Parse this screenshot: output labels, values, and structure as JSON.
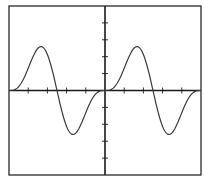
{
  "chart_data": {
    "type": "line",
    "title": "",
    "xlabel": "",
    "ylabel": "",
    "grid": false,
    "legend": null,
    "xlim": [
      -5,
      5
    ],
    "ylim": [
      -5,
      5
    ],
    "x_ticks": [
      -4,
      -3,
      -2,
      -1,
      0,
      1,
      2,
      3,
      4
    ],
    "y_ticks": [
      -4,
      -3,
      -2,
      -1,
      0,
      1,
      2,
      3,
      4
    ],
    "tick_labels_shown": false,
    "series": [
      {
        "name": "waveform",
        "color": "#3a3a3a",
        "x": [
          -5.0,
          -4.75,
          -4.5,
          -4.25,
          -4.0,
          -3.75,
          -3.5,
          -3.25,
          -3.0,
          -2.75,
          -2.5,
          -2.25,
          -2.0,
          -1.75,
          -1.5,
          -1.25,
          -1.0,
          -0.75,
          -0.5,
          -0.25,
          0.0,
          0.25,
          0.5,
          0.75,
          1.0,
          1.25,
          1.5,
          1.75,
          2.0,
          2.25,
          2.5,
          2.75,
          3.0,
          3.25,
          3.5,
          3.75,
          4.0,
          4.25,
          4.5,
          4.75,
          5.0
        ],
        "y": [
          0.0,
          0.02,
          0.16,
          0.48,
          1.0,
          1.6,
          2.16,
          2.54,
          2.6,
          2.22,
          1.45,
          0.42,
          -0.62,
          -1.6,
          -2.32,
          -2.6,
          -2.44,
          -1.87,
          -1.06,
          -0.34,
          0.0,
          0.02,
          0.16,
          0.48,
          1.0,
          1.6,
          2.16,
          2.54,
          2.6,
          2.22,
          1.45,
          0.42,
          -0.62,
          -1.6,
          -2.32,
          -2.6,
          -2.44,
          -1.87,
          -1.06,
          -0.34,
          0.0
        ]
      }
    ]
  }
}
